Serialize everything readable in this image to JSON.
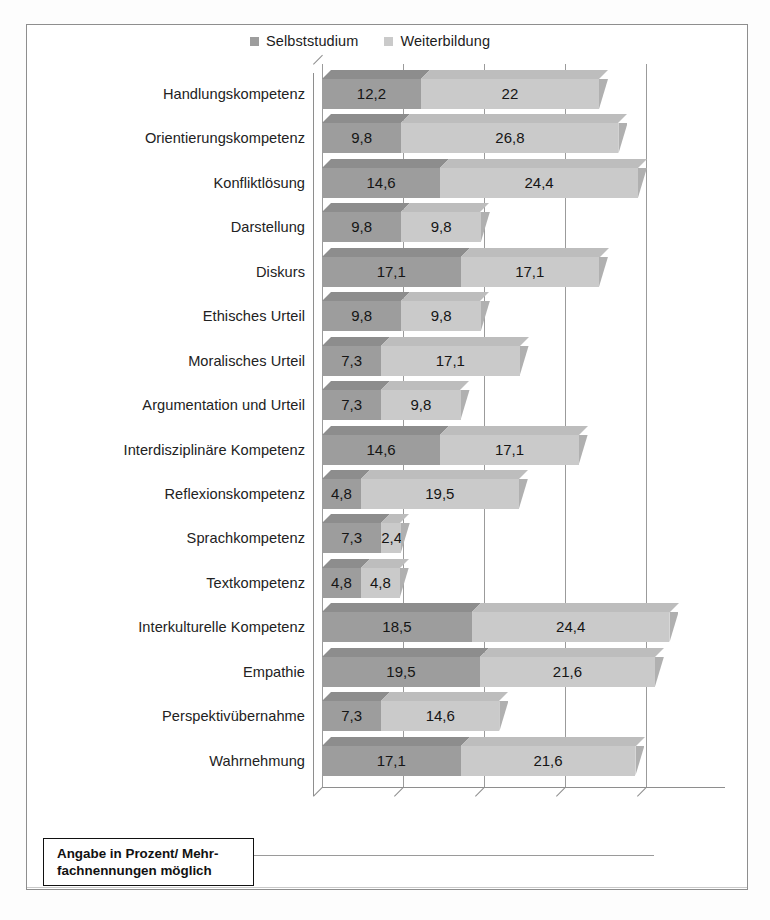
{
  "figure": {
    "footnote_line1": "Angabe in Prozent/ Mehr-",
    "footnote_line2": "fachnennungen möglich"
  },
  "legend": {
    "items": [
      {
        "label": "Selbststudium",
        "color": "#9d9d9d"
      },
      {
        "label": "Weiterbildung",
        "color": "#cacaca"
      }
    ]
  },
  "chart_data": {
    "type": "bar",
    "orientation": "horizontal",
    "stacked": true,
    "title": "",
    "subtitle": "",
    "xlabel": "",
    "ylabel": "",
    "xlim": [
      0,
      50
    ],
    "grid": true,
    "gridline_values": [
      0,
      10,
      20,
      30,
      40,
      50
    ],
    "legend_position": "top",
    "annotation": "Angabe in Prozent/ Mehrfachnennungen möglich",
    "units": "percent",
    "categories": [
      "Handlungskompetenz",
      "Orientierungskompetenz",
      "Konfliktlösung",
      "Darstellung",
      "Diskurs",
      "Ethisches Urteil",
      "Moralisches Urteil",
      "Argumentation und Urteil",
      "Interdisziplinäre Kompetenz",
      "Reflexionskompetenz",
      "Sprachkompetenz",
      "Textkompetenz",
      "Interkulturelle Kompetenz",
      "Empathie",
      "Perspektivübernahme",
      "Wahrnehmung"
    ],
    "series": [
      {
        "name": "Selbststudium",
        "color": "#9d9d9d",
        "values": [
          12.2,
          9.8,
          14.6,
          9.8,
          17.1,
          9.8,
          7.3,
          7.3,
          14.6,
          4.8,
          7.3,
          4.8,
          18.5,
          19.5,
          7.3,
          17.1
        ],
        "labels": [
          "12,2",
          "9,8",
          "14,6",
          "9,8",
          "17,1",
          "9,8",
          "7,3",
          "7,3",
          "14,6",
          "4,8",
          "7,3",
          "4,8",
          "18,5",
          "19,5",
          "7,3",
          "17,1"
        ]
      },
      {
        "name": "Weiterbildung",
        "color": "#cacaca",
        "values": [
          22,
          26.8,
          24.4,
          9.8,
          17.1,
          9.8,
          17.1,
          9.8,
          17.1,
          19.5,
          2.4,
          4.8,
          24.4,
          21.6,
          14.6,
          21.6
        ],
        "labels": [
          "22",
          "26,8",
          "24,4",
          "9,8",
          "17,1",
          "9,8",
          "17,1",
          "9,8",
          "17,1",
          "19,5",
          "2,4",
          "4,8",
          "24,4",
          "21,6",
          "14,6",
          "21,6"
        ]
      }
    ]
  }
}
